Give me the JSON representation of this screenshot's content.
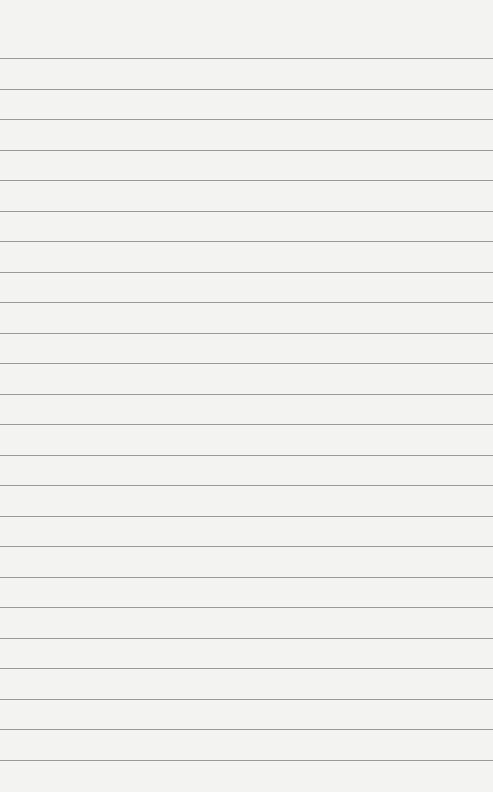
{
  "paper": {
    "type": "lined-paper",
    "background_color": "#f3f3f2",
    "line_color": "#8a8a8a",
    "first_line_y": 58,
    "line_spacing": 30.5,
    "line_count": 24
  }
}
